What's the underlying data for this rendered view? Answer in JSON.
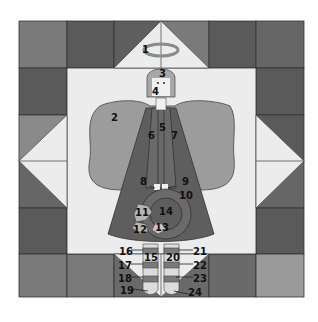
{
  "diagram": {
    "type": "quilt-block-pattern",
    "grid": {
      "cols": 6,
      "rows": 6,
      "x": 19,
      "y": 21,
      "size": 285,
      "height": 276
    },
    "colors": {
      "dark": "#5a5a5a",
      "medium_dark": "#666666",
      "medium": "#7a7a7a",
      "light_gray": "#9a9a9a",
      "background_light": "#ececec",
      "wing": "#9c9c9c",
      "robe": "#5e5e5e",
      "robe_panel": "#6a6a6a",
      "hair": "#a8a8a8",
      "face": "#f0f0f0",
      "halo": "#a5a5a5",
      "outline": "#333333"
    },
    "piece_labels": [
      {
        "id": "1",
        "x": 146,
        "y": 50
      },
      {
        "id": "2",
        "x": 114,
        "y": 118
      },
      {
        "id": "3",
        "x": 162,
        "y": 74
      },
      {
        "id": "4",
        "x": 155,
        "y": 92
      },
      {
        "id": "5",
        "x": 162,
        "y": 128
      },
      {
        "id": "6",
        "x": 151,
        "y": 136
      },
      {
        "id": "7",
        "x": 174,
        "y": 136
      },
      {
        "id": "8",
        "x": 143,
        "y": 182
      },
      {
        "id": "9",
        "x": 185,
        "y": 182
      },
      {
        "id": "10",
        "x": 184,
        "y": 196
      },
      {
        "id": "11",
        "x": 140,
        "y": 213
      },
      {
        "id": "12",
        "x": 138,
        "y": 230
      },
      {
        "id": "13",
        "x": 160,
        "y": 228
      },
      {
        "id": "14",
        "x": 164,
        "y": 212
      },
      {
        "id": "15",
        "x": 147,
        "y": 258
      },
      {
        "id": "16",
        "x": 125,
        "y": 252
      },
      {
        "id": "17",
        "x": 124,
        "y": 266
      },
      {
        "id": "18",
        "x": 124,
        "y": 279
      },
      {
        "id": "19",
        "x": 126,
        "y": 291
      },
      {
        "id": "20",
        "x": 171,
        "y": 258
      },
      {
        "id": "21",
        "x": 196,
        "y": 252
      },
      {
        "id": "22",
        "x": 196,
        "y": 266
      },
      {
        "id": "23",
        "x": 196,
        "y": 279
      },
      {
        "id": "24",
        "x": 190,
        "y": 293
      }
    ]
  }
}
